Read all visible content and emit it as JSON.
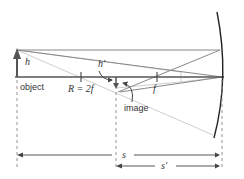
{
  "diagram": {
    "labels": {
      "object_height": "h",
      "image_height": "h′",
      "object": "object",
      "radius": "R = 2f",
      "focal": "f",
      "image": "image",
      "object_distance": "s",
      "image_distance": "s′"
    },
    "colors": {
      "axis": "#555555",
      "object_arrow": "#555555",
      "ray_dark": "#777777",
      "ray_light": "#c8c8c8",
      "mirror": "#222222",
      "dashed": "#888888"
    }
  }
}
